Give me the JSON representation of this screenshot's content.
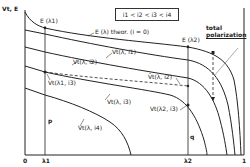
{
  "axes": {
    "y_label": "Vt, E",
    "x_ticks": [
      "0",
      "λ1",
      "λ2",
      "1"
    ]
  },
  "legend": {
    "text": "i1 < i2 < i3 < i4"
  },
  "labels": {
    "e_lambda1": "E (λ1)",
    "e_lambda2": "E (λ2)",
    "e_theor": "E (λ) theor. (i = 0)",
    "vt_i1": "Vt(λ, i1)",
    "vt_i2": "Vt(λ, i2)",
    "vt_i3": "Vt(λ, i3)",
    "vt_i4": "Vt(λ, i4)",
    "vt_l1_i3": "Vt(λ1, i3)",
    "vt_l2_i3": "Vt(λ2, i3)",
    "vbar_i2": "V̄t(λ, i2)",
    "total_polarization": "total polarization",
    "total_polarization_line1": "total",
    "total_polarization_line2": "polarization",
    "p": "p",
    "q": "q"
  },
  "colors": {
    "line": "#222222",
    "background": "#ffffff"
  }
}
